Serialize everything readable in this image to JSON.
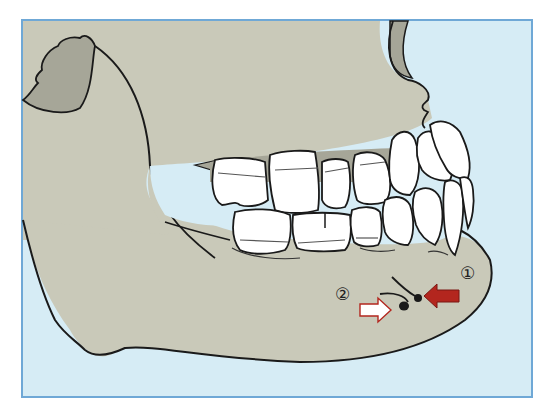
{
  "figure": {
    "labels": [
      {
        "id": "1",
        "text": "①",
        "arrow": "red-filled-arrow",
        "direction": "left"
      },
      {
        "id": "2",
        "text": "②",
        "arrow": "white-outlined-arrow",
        "direction": "right"
      }
    ],
    "colors": {
      "frame_border": "#6fa8d6",
      "background": "#d6ecf5",
      "bone": "#c9c9b9",
      "bone_shadow": "#a6a698",
      "tooth": "#ffffff",
      "outline": "#1a1a1a",
      "arrow_1": "#b3261e",
      "arrow_2": "#ffffff",
      "arrow_2_outline": "#b3261e"
    }
  }
}
